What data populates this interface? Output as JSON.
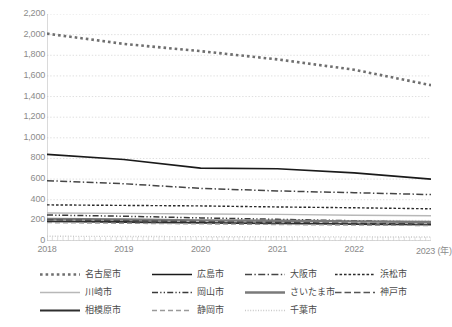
{
  "chart_data": {
    "type": "line",
    "title": "",
    "xlabel": "(年)",
    "ylabel": "",
    "x": [
      2018,
      2019,
      2020,
      2021,
      2022,
      2023
    ],
    "xlim": [
      2018,
      2023
    ],
    "ylim": [
      0,
      2200
    ],
    "yticks": [
      0,
      200,
      400,
      600,
      800,
      1000,
      1200,
      1400,
      1600,
      1800,
      2000,
      2200
    ],
    "ytick_labels": [
      "0",
      "200",
      "400",
      "600",
      "800",
      "1,000",
      "1,200",
      "1,400",
      "1,600",
      "1,800",
      "2,000",
      "2,200"
    ],
    "xtick_labels": [
      "2018",
      "2019",
      "2020",
      "2021",
      "2022",
      "2023 (年)"
    ],
    "grid": true,
    "legend_position": "bottom",
    "series": [
      {
        "name": "名古屋市",
        "style": "dotted",
        "color": "#6f6f6f",
        "width": 2.6,
        "values": [
          2010,
          1910,
          1840,
          1760,
          1660,
          1510
        ]
      },
      {
        "name": "広島市",
        "style": "solid",
        "color": "#1a1a1a",
        "width": 1.7,
        "values": [
          840,
          790,
          706,
          700,
          660,
          600
        ]
      },
      {
        "name": "大阪市",
        "style": "dash-dot",
        "color": "#454545",
        "width": 1.5,
        "values": [
          585,
          555,
          510,
          485,
          468,
          450
        ]
      },
      {
        "name": "浜松市",
        "style": "dashed-fine",
        "color": "#2b2b2b",
        "width": 1.4,
        "values": [
          350,
          345,
          340,
          330,
          322,
          312
        ]
      },
      {
        "name": "川崎市",
        "style": "solid",
        "color": "#b8b8b8",
        "width": 1.4,
        "values": [
          272,
          268,
          262,
          258,
          250,
          244
        ]
      },
      {
        "name": "岡山市",
        "style": "dash-dot-dot",
        "color": "#3a3a3a",
        "width": 1.5,
        "values": [
          252,
          240,
          224,
          210,
          196,
          182
        ]
      },
      {
        "name": "さいたま市",
        "style": "solid-thick",
        "color": "#7a7a7a",
        "width": 2.4,
        "values": [
          214,
          208,
          200,
          196,
          190,
          184
        ]
      },
      {
        "name": "神戸市",
        "style": "dashed-long",
        "color": "#555555",
        "width": 1.5,
        "values": [
          206,
          198,
          188,
          180,
          172,
          164
        ]
      },
      {
        "name": "相模原市",
        "style": "solid",
        "color": "#2e2e2e",
        "width": 1.8,
        "values": [
          190,
          184,
          176,
          170,
          164,
          158
        ]
      },
      {
        "name": "静岡市",
        "style": "dashed-med",
        "color": "#9a9a9a",
        "width": 1.4,
        "values": [
          178,
          172,
          166,
          160,
          154,
          150
        ]
      },
      {
        "name": "千葉市",
        "style": "dotted-fine",
        "color": "#c9c9c9",
        "width": 1.4,
        "values": [
          46,
          44,
          42,
          41,
          40,
          38
        ]
      }
    ]
  },
  "legend": {
    "rows": [
      [
        "名古屋市",
        "広島市",
        "大阪市",
        "浜松市"
      ],
      [
        "川崎市",
        "岡山市",
        "さいたま市",
        "神戸市"
      ],
      [
        "相模原市",
        "静岡市",
        "千葉市"
      ]
    ]
  },
  "axis": {
    "y_labels": [
      "2,200",
      "2,000",
      "1,800",
      "1,600",
      "1,400",
      "1,200",
      "1,000",
      "800",
      "600",
      "400",
      "200",
      "0"
    ],
    "x_labels": [
      "2018",
      "2019",
      "2020",
      "2021",
      "2022",
      "2023 (年)"
    ]
  }
}
